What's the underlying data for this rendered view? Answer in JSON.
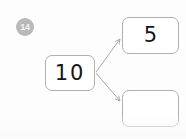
{
  "worksheet": {
    "question_number": "14",
    "type": "number-bond",
    "background_color": "#fdfdfd",
    "badge_color": "#b9b9b9",
    "box_border_color": "#b0b0b0",
    "connector_color": "#a8a8a8",
    "text_color": "#151515"
  },
  "diagram": {
    "whole": {
      "label": "whole-box",
      "value": "10"
    },
    "parts": [
      {
        "label": "part-box-filled",
        "value": "5"
      },
      {
        "label": "part-box-empty",
        "value": ""
      }
    ],
    "connectors": [
      {
        "from": "whole",
        "to": "part-box-filled",
        "arrow": "true"
      },
      {
        "from": "whole",
        "to": "part-box-empty",
        "arrow": "true"
      }
    ]
  }
}
